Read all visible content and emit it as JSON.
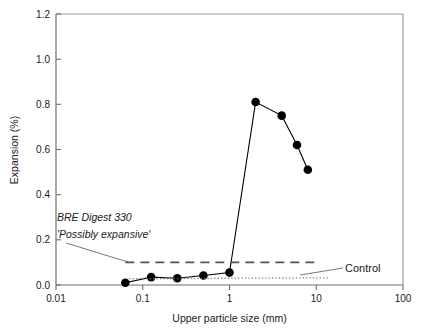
{
  "chart_data": {
    "type": "line",
    "title": "",
    "xlabel": "Upper particle size (mm)",
    "ylabel": "Expansion (%)",
    "xscale": "log",
    "xlim": [
      0.01,
      100
    ],
    "ylim": [
      0.0,
      1.2
    ],
    "xticks": [
      "0.01",
      "0.1",
      "1",
      "10",
      "100"
    ],
    "xtick_values": [
      0.01,
      0.1,
      1,
      10,
      100
    ],
    "yticks": [
      "0.0",
      "0.2",
      "0.4",
      "0.6",
      "0.8",
      "1.0",
      "1.2"
    ],
    "ytick_values": [
      0.0,
      0.2,
      0.4,
      0.6,
      0.8,
      1.0,
      1.2
    ],
    "grid": false,
    "legend": "none",
    "series": [
      {
        "name": "Expansion",
        "marker": "filled-circle",
        "linestyle": "solid",
        "color": "#000000",
        "x": [
          0.063,
          0.125,
          0.25,
          0.5,
          1.0,
          2.0,
          4.0,
          6.0,
          8.0
        ],
        "values": [
          0.01,
          0.035,
          0.03,
          0.042,
          0.055,
          0.81,
          0.75,
          0.62,
          0.51
        ]
      },
      {
        "name": "BRE Digest 330 'Possibly expansive'",
        "marker": "none",
        "linestyle": "dashed",
        "color": "#555555",
        "x": [
          0.063,
          10.0
        ],
        "values": [
          0.1,
          0.1
        ]
      },
      {
        "name": "Control",
        "marker": "none",
        "linestyle": "dotted",
        "color": "#777777",
        "x": [
          0.07,
          14.0
        ],
        "values": [
          0.028,
          0.032
        ]
      }
    ],
    "annotations": [
      {
        "name": "bre-digest-annotation",
        "line1": "BRE Digest 330",
        "line2": "'Possibly expansive'",
        "style": "italic",
        "points_to": "dashed-threshold-line"
      },
      {
        "name": "control-annotation",
        "text": "Control",
        "style": "normal",
        "points_to": "dotted-control-line"
      }
    ]
  }
}
